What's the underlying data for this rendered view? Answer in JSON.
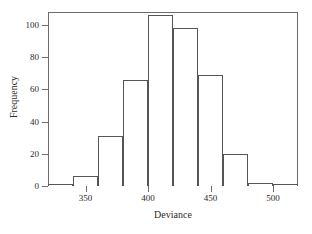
{
  "chart_data": {
    "type": "bar",
    "chart_subtype": "histogram",
    "title": "",
    "xlabel": "Deviance",
    "ylabel": "Frequency",
    "xlim": [
      320,
      520
    ],
    "ylim": [
      0,
      108
    ],
    "grid": false,
    "legend": null,
    "bin_width": 20,
    "bin_edges": [
      320,
      340,
      360,
      380,
      400,
      420,
      440,
      460,
      480,
      500,
      520
    ],
    "categories": [
      "320-340",
      "340-360",
      "360-380",
      "380-400",
      "400-420",
      "420-440",
      "440-460",
      "460-480",
      "480-500",
      "500-520"
    ],
    "bin_centers": [
      330,
      350,
      370,
      390,
      410,
      430,
      450,
      470,
      490,
      510
    ],
    "values": [
      1,
      6,
      31,
      66,
      106,
      98,
      69,
      20,
      2,
      1
    ],
    "xticks": [
      350,
      400,
      450,
      500
    ],
    "xtick_labels": [
      "350",
      "400",
      "450",
      "500"
    ],
    "yticks": [
      0,
      20,
      40,
      60,
      80,
      100
    ],
    "ytick_labels": [
      "0",
      "20",
      "40",
      "60",
      "80",
      "100"
    ],
    "colors": {
      "bar_fill": "#ffffff",
      "bar_edge": "#555555",
      "frame": "#6b6b6b",
      "text": "#2b2b2b",
      "background": "#ffffff"
    }
  }
}
